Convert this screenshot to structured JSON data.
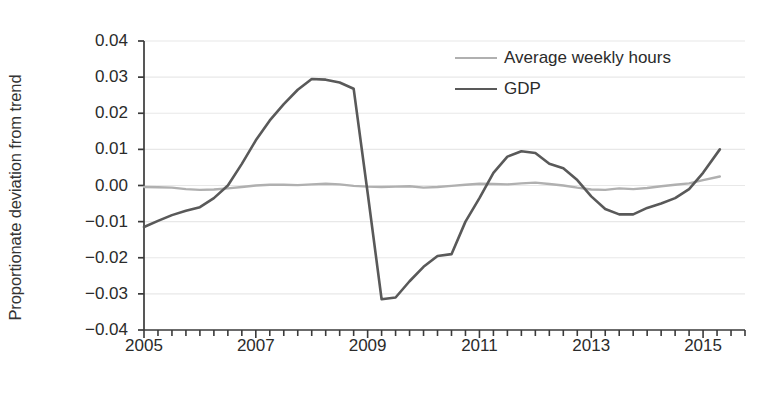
{
  "chart_data": {
    "type": "line",
    "title": "",
    "xlabel": "",
    "ylabel": "Proportionate deviation from trend",
    "xlim": [
      2005,
      2015.75
    ],
    "ylim": [
      -0.04,
      0.04
    ],
    "grid": true,
    "legend_position": "top-right",
    "ytick_labels": [
      "0.04",
      "0.03",
      "0.02",
      "0.01",
      "0.00",
      "−0.01",
      "−0.02",
      "−0.03",
      "−0.04"
    ],
    "ytick_values": [
      0.04,
      0.03,
      0.02,
      0.01,
      0.0,
      -0.01,
      -0.02,
      -0.03,
      -0.04
    ],
    "xtick_labels": [
      "2005",
      "2007",
      "2009",
      "2011",
      "2013",
      "2015"
    ],
    "xtick_values": [
      2005,
      2007,
      2009,
      2011,
      2013,
      2015
    ],
    "xminor_step": 0.25,
    "series": [
      {
        "name": "Average weekly hours",
        "color": "#b0b0b0",
        "width": 2.4,
        "x": [
          2005.0,
          2005.25,
          2005.5,
          2005.75,
          2006.0,
          2006.25,
          2006.5,
          2006.75,
          2007.0,
          2007.25,
          2007.5,
          2007.75,
          2008.0,
          2008.25,
          2008.5,
          2008.75,
          2009.0,
          2009.25,
          2009.5,
          2009.75,
          2010.0,
          2010.25,
          2010.5,
          2010.75,
          2011.0,
          2011.25,
          2011.5,
          2011.75,
          2012.0,
          2012.25,
          2012.5,
          2012.75,
          2013.0,
          2013.25,
          2013.5,
          2013.75,
          2014.0,
          2014.25,
          2014.5,
          2014.75,
          2015.0,
          2015.3
        ],
        "values": [
          -0.0004,
          -0.0005,
          -0.0006,
          -0.001,
          -0.0012,
          -0.0011,
          -0.0008,
          -0.0004,
          0.0,
          0.0002,
          0.0002,
          0.0001,
          0.0003,
          0.0005,
          0.0003,
          -0.0001,
          -0.0003,
          -0.0004,
          -0.0003,
          -0.0002,
          -0.0006,
          -0.0004,
          -0.0001,
          0.0002,
          0.0005,
          0.0004,
          0.0003,
          0.0006,
          0.0008,
          0.0004,
          0.0,
          -0.0006,
          -0.0011,
          -0.0012,
          -0.0008,
          -0.001,
          -0.0007,
          -0.0002,
          0.0002,
          0.0006,
          0.0015,
          0.0025
        ]
      },
      {
        "name": "GDP",
        "color": "#595959",
        "width": 2.6,
        "x": [
          2005.0,
          2005.25,
          2005.5,
          2005.75,
          2006.0,
          2006.25,
          2006.5,
          2006.75,
          2007.0,
          2007.25,
          2007.5,
          2007.75,
          2008.0,
          2008.25,
          2008.5,
          2008.75,
          2009.0,
          2009.25,
          2009.5,
          2009.75,
          2010.0,
          2010.25,
          2010.5,
          2010.75,
          2011.0,
          2011.25,
          2011.5,
          2011.75,
          2012.0,
          2012.25,
          2012.5,
          2012.75,
          2013.0,
          2013.25,
          2013.5,
          2013.75,
          2014.0,
          2014.25,
          2014.5,
          2014.75,
          2015.0,
          2015.3
        ],
        "values": [
          -0.0115,
          -0.0098,
          -0.0082,
          -0.007,
          -0.006,
          -0.0035,
          0.0,
          0.006,
          0.0125,
          0.018,
          0.0225,
          0.0265,
          0.0295,
          0.0293,
          0.0285,
          0.0268,
          -0.002,
          -0.0315,
          -0.031,
          -0.0265,
          -0.0225,
          -0.0195,
          -0.019,
          -0.01,
          -0.0035,
          0.0035,
          0.008,
          0.0095,
          0.009,
          0.006,
          0.0048,
          0.0015,
          -0.003,
          -0.0065,
          -0.008,
          -0.008,
          -0.0062,
          -0.005,
          -0.0035,
          -0.001,
          0.0035,
          0.01
        ]
      }
    ]
  },
  "legend": {
    "items": [
      {
        "label": "Average weekly hours"
      },
      {
        "label": "GDP"
      }
    ]
  },
  "axes": {
    "y_title": "Proportionate deviation from trend"
  },
  "colors": {
    "gdp_line": "#595959",
    "hours_line": "#b0b0b0",
    "grid": "#e8e8e8",
    "axis": "#3a3a3a",
    "text": "#2b2b2b"
  }
}
